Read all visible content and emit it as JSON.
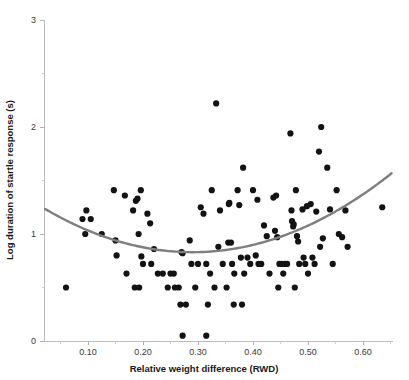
{
  "chart_data": {
    "type": "scatter",
    "title": "",
    "xlabel": "Relative weight difference (RWD)",
    "ylabel": "Log duration of startle response (s)",
    "xlim": [
      0.02,
      0.655
    ],
    "ylim": [
      0,
      3
    ],
    "grid": false,
    "legend": "none",
    "x_ticks": [
      0.1,
      0.2,
      0.3,
      0.4,
      0.5,
      0.6
    ],
    "x_tick_labels": [
      "0.10",
      "0.20",
      "0.30",
      "0.40",
      "0.50",
      "0.60"
    ],
    "x_minor_ticks": [
      0.05,
      0.15,
      0.25,
      0.35,
      0.45,
      0.55,
      0.65
    ],
    "y_ticks": [
      0,
      1,
      2,
      3
    ],
    "y_tick_labels": [
      "0",
      "1",
      "2",
      "3"
    ],
    "y_minor_ticks": [
      0.5,
      1.5,
      2.5
    ],
    "marker": "filled-circle",
    "marker_color": "#131313",
    "marker_radius": 3.1,
    "points": [
      [
        0.06,
        0.5
      ],
      [
        0.09,
        1.14
      ],
      [
        0.095,
        1.0
      ],
      [
        0.097,
        1.22
      ],
      [
        0.105,
        1.14
      ],
      [
        0.125,
        1.0
      ],
      [
        0.147,
        1.41
      ],
      [
        0.15,
        0.94
      ],
      [
        0.152,
        0.8
      ],
      [
        0.167,
        1.36
      ],
      [
        0.17,
        0.63
      ],
      [
        0.182,
        1.22
      ],
      [
        0.185,
        0.5
      ],
      [
        0.187,
        1.31
      ],
      [
        0.19,
        1.33
      ],
      [
        0.192,
        1.0
      ],
      [
        0.193,
        0.5
      ],
      [
        0.196,
        1.41
      ],
      [
        0.197,
        0.79
      ],
      [
        0.2,
        0.72
      ],
      [
        0.208,
        1.19
      ],
      [
        0.213,
        1.1
      ],
      [
        0.215,
        0.72
      ],
      [
        0.22,
        0.86
      ],
      [
        0.227,
        0.63
      ],
      [
        0.236,
        0.63
      ],
      [
        0.245,
        0.5
      ],
      [
        0.25,
        0.63
      ],
      [
        0.256,
        0.63
      ],
      [
        0.258,
        0.5
      ],
      [
        0.265,
        0.5
      ],
      [
        0.268,
        0.34
      ],
      [
        0.27,
        0.83
      ],
      [
        0.272,
        0.82
      ],
      [
        0.272,
        0.05
      ],
      [
        0.278,
        0.34
      ],
      [
        0.285,
        0.94
      ],
      [
        0.288,
        0.72
      ],
      [
        0.295,
        0.5
      ],
      [
        0.3,
        0.72
      ],
      [
        0.305,
        1.25
      ],
      [
        0.31,
        1.19
      ],
      [
        0.315,
        0.72
      ],
      [
        0.315,
        0.05
      ],
      [
        0.318,
        0.34
      ],
      [
        0.322,
        0.63
      ],
      [
        0.325,
        1.41
      ],
      [
        0.33,
        0.5
      ],
      [
        0.333,
        2.22
      ],
      [
        0.337,
        0.88
      ],
      [
        0.34,
        1.22
      ],
      [
        0.345,
        0.72
      ],
      [
        0.352,
        0.5
      ],
      [
        0.355,
        0.92
      ],
      [
        0.356,
        1.28
      ],
      [
        0.357,
        1.29
      ],
      [
        0.36,
        0.92
      ],
      [
        0.362,
        0.72
      ],
      [
        0.365,
        0.34
      ],
      [
        0.366,
        0.63
      ],
      [
        0.372,
        1.41
      ],
      [
        0.375,
        1.27
      ],
      [
        0.378,
        0.78
      ],
      [
        0.38,
        0.34
      ],
      [
        0.382,
        1.62
      ],
      [
        0.384,
        0.63
      ],
      [
        0.39,
        0.78
      ],
      [
        0.395,
        0.72
      ],
      [
        0.4,
        1.41
      ],
      [
        0.405,
        0.8
      ],
      [
        0.408,
        1.32
      ],
      [
        0.41,
        0.72
      ],
      [
        0.415,
        0.72
      ],
      [
        0.42,
        1.08
      ],
      [
        0.425,
        0.98
      ],
      [
        0.43,
        0.63
      ],
      [
        0.437,
        1.34
      ],
      [
        0.44,
        1.03
      ],
      [
        0.442,
        1.36
      ],
      [
        0.444,
        0.97
      ],
      [
        0.446,
        0.5
      ],
      [
        0.448,
        0.72
      ],
      [
        0.452,
        0.72
      ],
      [
        0.455,
        0.63
      ],
      [
        0.458,
        0.72
      ],
      [
        0.462,
        0.72
      ],
      [
        0.468,
        1.94
      ],
      [
        0.47,
        1.22
      ],
      [
        0.471,
        1.12
      ],
      [
        0.473,
        1.07
      ],
      [
        0.474,
        1.09
      ],
      [
        0.476,
        0.5
      ],
      [
        0.478,
        1.41
      ],
      [
        0.48,
        0.98
      ],
      [
        0.482,
        0.93
      ],
      [
        0.484,
        0.72
      ],
      [
        0.49,
        1.23
      ],
      [
        0.492,
        0.78
      ],
      [
        0.495,
        0.72
      ],
      [
        0.498,
        1.26
      ],
      [
        0.5,
        0.63
      ],
      [
        0.505,
        1.28
      ],
      [
        0.508,
        0.78
      ],
      [
        0.512,
        0.72
      ],
      [
        0.515,
        1.21
      ],
      [
        0.52,
        1.77
      ],
      [
        0.522,
        0.88
      ],
      [
        0.524,
        2.0
      ],
      [
        0.527,
        0.96
      ],
      [
        0.535,
        1.62
      ],
      [
        0.54,
        1.23
      ],
      [
        0.545,
        0.72
      ],
      [
        0.552,
        1.41
      ],
      [
        0.556,
        1.0
      ],
      [
        0.562,
        0.97
      ],
      [
        0.568,
        1.22
      ],
      [
        0.572,
        0.88
      ],
      [
        0.635,
        1.25
      ]
    ],
    "fit_curve": {
      "name": "quadratic fit",
      "color": "#7f7f7f",
      "equation_description": "U-shaped quadratic trend line",
      "vertex_x": 0.29,
      "vertex_y": 0.83,
      "x_start": 0.022,
      "x_end": 0.652,
      "y_start": 1.26,
      "y_end": 1.52
    }
  }
}
